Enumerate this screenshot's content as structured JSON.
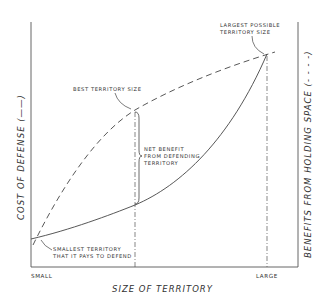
{
  "diagram": {
    "x_axis_label": "SIZE OF TERRITORY",
    "x_tick_small": "SMALL",
    "x_tick_large": "LARGE",
    "left_axis_label": "COST OF DEFENSE (——)",
    "right_axis_label": "BENEFITS FROM HOLDING SPACE (- - - -)",
    "annotations": {
      "largest_line1": "LARGEST POSSIBLE",
      "largest_line2": "TERRITORY SIZE",
      "best": "BEST TERRITORY SIZE",
      "net_line1": "NET BENEFIT",
      "net_line2": "FROM DEFENDING",
      "net_line3": "TERRITORY",
      "smallest_line1": "SMALLEST TERRITORY",
      "smallest_line2": "THAT IT PAYS TO DEFEND"
    },
    "curves": [
      {
        "name": "Cost of defense",
        "style": "solid"
      },
      {
        "name": "Benefits from holding space",
        "style": "dashed"
      }
    ],
    "colors": {
      "line": "#444444",
      "text": "#333333",
      "background": "#ffffff"
    }
  }
}
